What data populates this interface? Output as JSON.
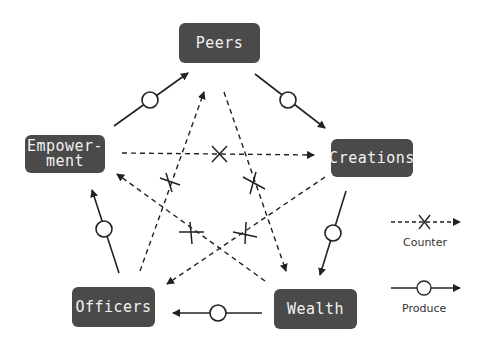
{
  "nodes": {
    "peers": {
      "label": "Peers"
    },
    "creations": {
      "label": "Creations"
    },
    "wealth": {
      "label": "Wealth"
    },
    "officers": {
      "label": "Officers"
    },
    "empowerment": {
      "label": "Empower-\nment"
    }
  },
  "legend": {
    "counter": {
      "label": "Counter"
    },
    "produce": {
      "label": "Produce"
    }
  },
  "edges": {
    "produce": [
      {
        "from": "Empowerment",
        "to": "Peers"
      },
      {
        "from": "Peers",
        "to": "Creations"
      },
      {
        "from": "Creations",
        "to": "Wealth"
      },
      {
        "from": "Wealth",
        "to": "Officers"
      },
      {
        "from": "Officers",
        "to": "Empowerment"
      }
    ],
    "counter": [
      {
        "from": "Empowerment",
        "to": "Creations"
      },
      {
        "from": "Creations",
        "to": "Officers"
      },
      {
        "from": "Officers",
        "to": "Peers"
      },
      {
        "from": "Peers",
        "to": "Wealth"
      },
      {
        "from": "Wealth",
        "to": "Empowerment"
      }
    ]
  },
  "colors": {
    "node_bg": "#4a4a4a",
    "node_text": "#f2f2f2",
    "line": "#222222"
  }
}
